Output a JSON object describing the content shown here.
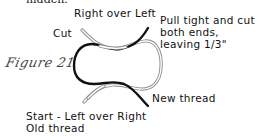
{
  "top_text_fragment": "hidden.",
  "figure": {
    "label": "Figure 21"
  },
  "labels": {
    "right_over_left": "Right over Left",
    "cut": "Cut",
    "pull_tight_line1": "Pull tight and cut",
    "pull_tight_line2": "both ends,",
    "pull_tight_line3": "leaving 1/3\"",
    "new_thread": "New thread",
    "start_line1": "Start - Left over Right",
    "start_line2": "Old thread"
  },
  "threads": {
    "old_thread": {
      "name": "Old thread",
      "color": "#9a9a9a",
      "style": "double-outline"
    },
    "new_thread": {
      "name": "New thread",
      "color": "#111111",
      "style": "solid"
    }
  }
}
